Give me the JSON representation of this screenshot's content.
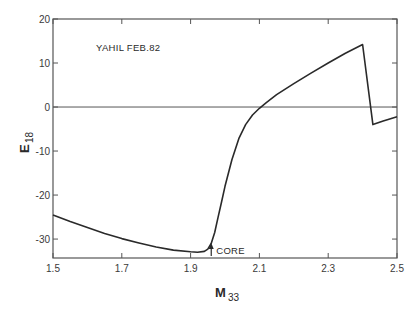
{
  "chart_data": {
    "type": "line",
    "title": "",
    "annotation": "YAHIL FEB.82",
    "xlabel": "M",
    "xlabel_subscript": "33",
    "ylabel": "E",
    "ylabel_subscript": "18",
    "xlim": [
      1.5,
      2.5
    ],
    "ylim": [
      -34.3,
      20
    ],
    "x_ticks": [
      "1.5",
      "1.7",
      "1.9",
      "2.1",
      "2.3",
      "2.5"
    ],
    "x_tick_values": [
      1.5,
      1.7,
      1.9,
      2.1,
      2.3,
      2.5
    ],
    "y_ticks": [
      "20",
      "10",
      "0",
      "-10",
      "-20",
      "-30"
    ],
    "y_tick_values": [
      20,
      10,
      0,
      -10,
      -20,
      -30
    ],
    "zero_line": true,
    "grid": false,
    "legend": null,
    "marker": {
      "label": "CORE",
      "x": 1.96,
      "symbol": "up-arrow"
    },
    "series": [
      {
        "name": "E18 vs M33",
        "x": [
          1.5,
          1.55,
          1.6,
          1.65,
          1.7,
          1.75,
          1.8,
          1.85,
          1.9,
          1.92,
          1.94,
          1.95,
          1.96,
          1.97,
          1.98,
          1.99,
          2.0,
          2.02,
          2.04,
          2.06,
          2.08,
          2.1,
          2.12,
          2.15,
          2.2,
          2.25,
          2.3,
          2.35,
          2.4,
          2.43,
          2.46,
          2.5
        ],
        "y": [
          -24.5,
          -26.0,
          -27.4,
          -28.7,
          -29.9,
          -30.9,
          -31.8,
          -32.5,
          -32.9,
          -33.0,
          -32.8,
          -32.3,
          -31.0,
          -28.5,
          -25.0,
          -21.5,
          -18.0,
          -12.0,
          -7.2,
          -4.0,
          -1.8,
          -0.3,
          1.0,
          2.8,
          5.3,
          7.7,
          10.0,
          12.2,
          14.2,
          -4.0,
          -3.2,
          -2.2
        ]
      }
    ]
  },
  "caption": ""
}
